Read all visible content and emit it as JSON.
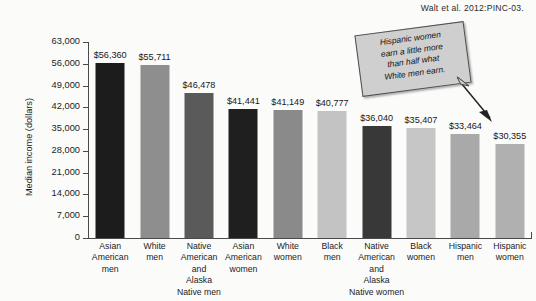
{
  "citation": "Walt et al. 2012:PINC-03.",
  "callout": {
    "line1": "Hispanic women",
    "line2": "earn a little more",
    "line3": "than half  what",
    "line4": "White men earn."
  },
  "axis": {
    "y_title": "Median income (dollars)",
    "tick_labels": [
      "63,000",
      "56,000",
      "49,000",
      "42,000",
      "35,000",
      "28,000",
      "21,000",
      "14,000",
      "7,000",
      "0"
    ]
  },
  "chart_data": {
    "type": "bar",
    "title": "",
    "xlabel": "",
    "ylabel": "Median income (dollars)",
    "ylim": [
      0,
      63000
    ],
    "ytick_step": 7000,
    "yticks": [
      0,
      7000,
      14000,
      21000,
      28000,
      35000,
      42000,
      49000,
      56000,
      63000
    ],
    "grid": false,
    "legend": "none",
    "categories": [
      "Asian American men",
      "White men",
      "Native American and Alaska Native men",
      "Asian American women",
      "White women",
      "Black men",
      "Native American and Alaska Native women",
      "Black women",
      "Hispanic men",
      "Hispanic women"
    ],
    "category_lines": [
      [
        "Asian",
        "American",
        "men"
      ],
      [
        "White",
        "men"
      ],
      [
        "Native",
        "American",
        "and",
        "Alaska",
        "Native men"
      ],
      [
        "Asian",
        "American",
        "women"
      ],
      [
        "White",
        "women"
      ],
      [
        "Black",
        "men"
      ],
      [
        "Native",
        "American",
        "and",
        "Alaska",
        "Native women"
      ],
      [
        "Black",
        "women"
      ],
      [
        "Hispanic",
        "men"
      ],
      [
        "Hispanic",
        "women"
      ]
    ],
    "values": [
      56360,
      55711,
      46478,
      41441,
      41149,
      40777,
      36040,
      35407,
      33464,
      30355
    ],
    "value_labels": [
      "$56,360",
      "$55,711",
      "$46,478",
      "$41,441",
      "$41,149",
      "$40,777",
      "$36,040",
      "$35,407",
      "$33,464",
      "$30,355"
    ],
    "bar_colors": [
      "#1c1c1c",
      "#8e8e8e",
      "#5a5a5a",
      "#1f1f1f",
      "#8a8a8a",
      "#c3c3c3",
      "#383838",
      "#c6c6c6",
      "#a9a9a9",
      "#b0b0b0"
    ],
    "annotation": "Hispanic women earn a little more than half  what White men earn."
  },
  "colors": {
    "background": "#fbfbfa",
    "axis": "#4a4a4a",
    "text": "#1b1b1b",
    "callout_fill": "#cfcfcf",
    "callout_border": "#4f4f4f"
  }
}
